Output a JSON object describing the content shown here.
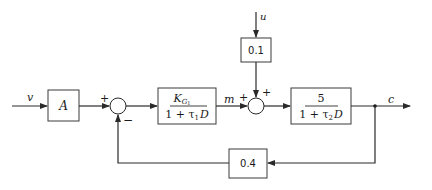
{
  "diagram": {
    "type": "block-diagram",
    "signals": {
      "input": "v",
      "disturbance": "u",
      "intermediate": "m",
      "output": "c"
    },
    "blocks": {
      "gain_a": {
        "label": "A"
      },
      "controller": {
        "numerator_main": "K",
        "numerator_sub": "G",
        "numerator_subsub": "1",
        "denominator": "1 + τ",
        "denominator_sub": "1",
        "denominator_tail": "D"
      },
      "disturbance_gain": {
        "label": "0.1"
      },
      "plant": {
        "numerator": "5",
        "denominator": "1 + τ",
        "denominator_sub": "2",
        "denominator_tail": "D"
      },
      "feedback_gain": {
        "label": "0.4"
      }
    },
    "junctions": {
      "sum1": {
        "sign_top_left": "+",
        "sign_bottom": "−"
      },
      "sum2": {
        "sign_left": "+",
        "sign_top": "+"
      }
    }
  }
}
